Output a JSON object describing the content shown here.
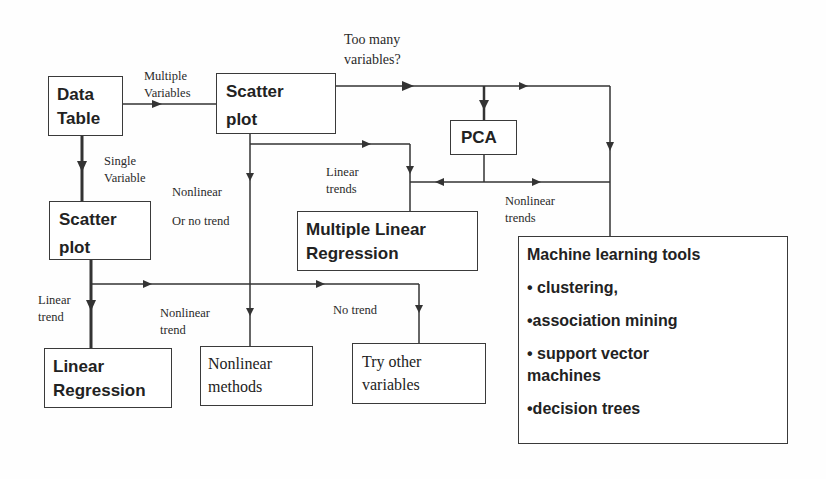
{
  "diagram": {
    "nodes": {
      "data_table": {
        "line1": "Data",
        "line2": "Table"
      },
      "scatter_top": {
        "line1": "Scatter",
        "line2": "plot"
      },
      "scatter_left": {
        "line1": "Scatter",
        "line2": "plot"
      },
      "pca": {
        "label": "PCA"
      },
      "mlr": {
        "line1": "Multiple Linear",
        "line2": "Regression"
      },
      "linear_regression": {
        "line1": "Linear",
        "line2": "Regression"
      },
      "nonlinear_methods": {
        "line1": "Nonlinear",
        "line2": "methods"
      },
      "try_other": {
        "line1": "Try other",
        "line2": "variables"
      },
      "ml_tools": {
        "title": "Machine learning tools",
        "items": [
          "• clustering,",
          "•association mining",
          "• support vector",
          "machines",
          "•decision trees"
        ]
      }
    },
    "edge_labels": {
      "multiple_variables": {
        "line1": "Multiple",
        "line2": "Variables"
      },
      "too_many_variables": {
        "line1": "Too many",
        "line2": "variables?"
      },
      "single_variable": {
        "line1": "Single",
        "line2": "Variable"
      },
      "nonlinear_or_no_trend": {
        "line1": "Nonlinear",
        "line2": "Or no trend"
      },
      "linear_trends": {
        "line1": "Linear",
        "line2": "trends"
      },
      "nonlinear_trends": {
        "line1": "Nonlinear",
        "line2": "trends"
      },
      "linear_trend": {
        "line1": "Linear",
        "line2": "trend"
      },
      "nonlinear_trend": {
        "line1": "Nonlinear",
        "line2": "trend"
      },
      "no_trend": {
        "label": "No trend"
      }
    },
    "colors": {
      "line": "#333333",
      "text": "#222222",
      "background": "#fefefe"
    }
  }
}
